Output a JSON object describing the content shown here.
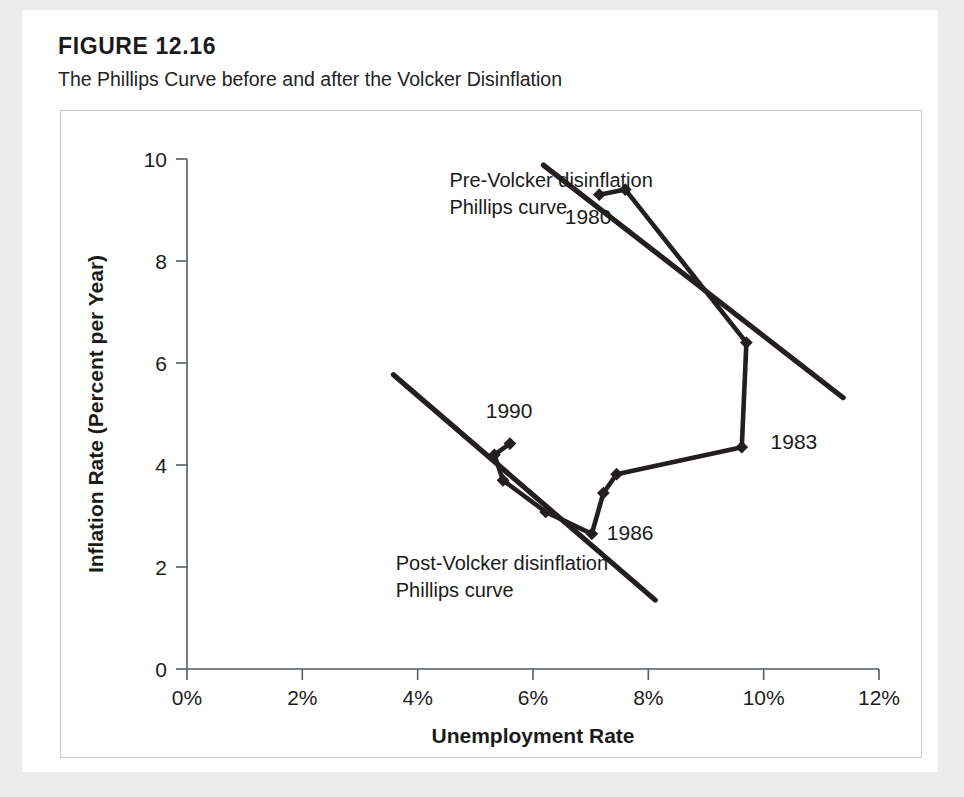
{
  "figure": {
    "number": "FIGURE 12.16",
    "title": "The Phillips Curve before and after the Volcker Disinflation"
  },
  "chart_data": {
    "type": "line",
    "title": "The Phillips Curve before and after the Volcker Disinflation",
    "xlabel": "Unemployment Rate",
    "ylabel": "Inflation Rate (Percent per Year)",
    "xlim": [
      0,
      12
    ],
    "ylim": [
      0,
      10
    ],
    "grid": false,
    "legend": "none",
    "x_tick_labels": [
      "0%",
      "2%",
      "4%",
      "6%",
      "8%",
      "10%",
      "12%"
    ],
    "x_ticks": [
      0,
      2,
      4,
      6,
      8,
      10,
      12
    ],
    "y_tick_labels": [
      "0",
      "2",
      "4",
      "6",
      "8",
      "10"
    ],
    "y_ticks": [
      0,
      2,
      4,
      6,
      8,
      10
    ],
    "series": [
      {
        "name": "Actual inflation-unemployment path (1980-1990s)",
        "kind": "line-with-markers",
        "points": [
          {
            "x": 7.15,
            "y": 9.3
          },
          {
            "x": 7.6,
            "y": 9.4
          },
          {
            "x": 9.7,
            "y": 6.4
          },
          {
            "x": 9.62,
            "y": 4.35
          },
          {
            "x": 7.45,
            "y": 3.82
          },
          {
            "x": 7.22,
            "y": 3.45
          },
          {
            "x": 7.02,
            "y": 2.65
          },
          {
            "x": 6.22,
            "y": 3.08
          },
          {
            "x": 5.48,
            "y": 3.7
          },
          {
            "x": 5.33,
            "y": 4.2
          },
          {
            "x": 5.6,
            "y": 4.42
          }
        ]
      },
      {
        "name": "Pre-Volcker disinflation Phillips curve",
        "kind": "trend-line",
        "points": [
          {
            "x": 6.18,
            "y": 9.88
          },
          {
            "x": 11.38,
            "y": 5.32
          }
        ]
      },
      {
        "name": "Post-Volcker disinflation Phillips curve",
        "kind": "trend-line",
        "points": [
          {
            "x": 3.58,
            "y": 5.77
          },
          {
            "x": 8.12,
            "y": 1.35
          }
        ]
      }
    ],
    "annotations": [
      {
        "id": "pre-volcker",
        "text_line1": "Pre-Volcker disinflation",
        "text_line2": "Phillips curve",
        "x": 4.55,
        "y": 9.45
      },
      {
        "id": "post-volcker",
        "text_line1": "Post-Volcker disinflation",
        "text_line2": "Phillips curve",
        "x": 3.62,
        "y": 1.95
      },
      {
        "id": "year-1980",
        "text": "1980",
        "x": 6.55,
        "y": 8.72
      },
      {
        "id": "year-1983",
        "text": "1983",
        "x": 10.12,
        "y": 4.32
      },
      {
        "id": "year-1986",
        "text": "1986",
        "x": 7.28,
        "y": 2.52
      },
      {
        "id": "year-1990",
        "text": "1990",
        "x": 5.18,
        "y": 4.92
      }
    ],
    "colors": {
      "ink": "#231f20",
      "axis": "#555c63",
      "panel_background": "#ffffff",
      "page_background": "#ececed"
    }
  }
}
